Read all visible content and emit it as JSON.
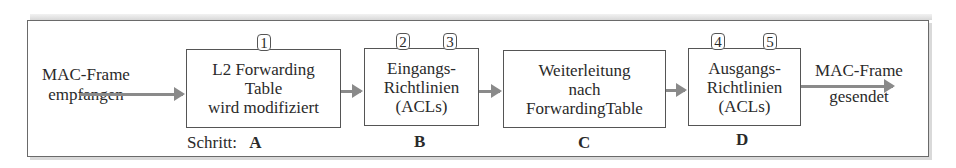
{
  "input": {
    "line1": "MAC-Frame",
    "line2": "empfangen"
  },
  "output": {
    "line1": "MAC-Frame",
    "line2": "gesendet"
  },
  "step_prefix": "Schritt:",
  "boxes": [
    {
      "step": "A",
      "lines": [
        "L2 Forwarding",
        "Table",
        "wird modifiziert"
      ],
      "badges": [
        "1"
      ]
    },
    {
      "step": "B",
      "lines": [
        "Eingangs-",
        "Richtlinien",
        "(ACLs)"
      ],
      "badges": [
        "2",
        "3"
      ]
    },
    {
      "step": "C",
      "lines": [
        "Weiterleitung",
        "nach",
        "ForwardingTable"
      ],
      "badges": []
    },
    {
      "step": "D",
      "lines": [
        "Ausgangs-",
        "Richtlinien",
        "(ACLs)"
      ],
      "badges": [
        "4",
        "5"
      ]
    }
  ],
  "colors": {
    "arrow": "#8a8a8a",
    "border": "#555555"
  }
}
